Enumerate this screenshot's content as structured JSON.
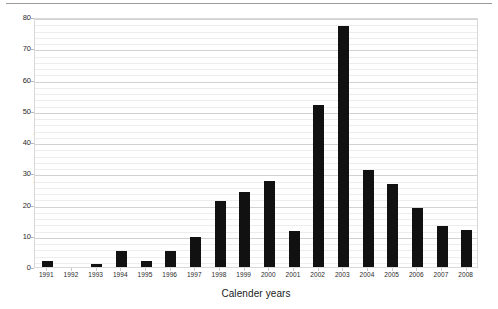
{
  "chart_data": {
    "type": "bar",
    "title": "",
    "subtitle": "",
    "xlabel": "Calender years",
    "ylabel": "Number of events",
    "categories": [
      "1991",
      "1992",
      "1993",
      "1994",
      "1995",
      "1996",
      "1997",
      "1998",
      "1999",
      "2000",
      "2001",
      "2002",
      "2003",
      "2004",
      "2005",
      "2006",
      "2007",
      "2008"
    ],
    "values": [
      2,
      0,
      1,
      5,
      2,
      5,
      9.5,
      21,
      24,
      27.5,
      11.5,
      52,
      77,
      31,
      26.5,
      19,
      13,
      12
    ],
    "series": [
      {
        "name": "Number of events",
        "values": [
          2,
          0,
          1,
          5,
          2,
          5,
          9.5,
          21,
          24,
          27.5,
          11.5,
          52,
          77,
          31,
          26.5,
          19,
          13,
          12
        ]
      }
    ],
    "ylim": [
      0,
      80
    ],
    "yticks": [
      0,
      10,
      20,
      30,
      40,
      50,
      60,
      70,
      80
    ],
    "ytick_labels": [
      "0",
      "10",
      "20",
      "30",
      "40",
      "50",
      "60",
      "70",
      "80"
    ],
    "minor_ytick_step": 2,
    "grid": true,
    "grid_axis": "y",
    "legend": false,
    "legend_position": "none",
    "bar_color": "#111111",
    "grid_color_minor": "#ededed",
    "grid_color_major": "#d2d2d2",
    "plot_border_color": "#d9d9d9",
    "background": "#ffffff",
    "annotations": []
  }
}
